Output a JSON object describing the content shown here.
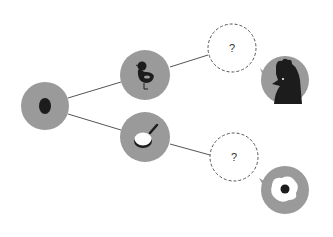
{
  "diagram": {
    "colors": {
      "node_fill": "#9a9a9a",
      "icon_dark": "#1c1c1c",
      "line": "#555555",
      "dashed_stroke": "#555555",
      "background": "#ffffff"
    },
    "nodes": [
      {
        "id": "egg",
        "icon": "egg-icon",
        "label": ""
      },
      {
        "id": "chick",
        "icon": "chick-icon",
        "label": ""
      },
      {
        "id": "pan",
        "icon": "frying-pan-icon",
        "label": ""
      },
      {
        "id": "unknown-top",
        "icon": "",
        "label": "?"
      },
      {
        "id": "unknown-bottom",
        "icon": "",
        "label": "?"
      },
      {
        "id": "chicken",
        "icon": "chicken-head-icon",
        "label": ""
      },
      {
        "id": "fried-egg",
        "icon": "fried-egg-icon",
        "label": ""
      }
    ],
    "edges": [
      {
        "from": "egg",
        "to": "chick"
      },
      {
        "from": "egg",
        "to": "pan"
      },
      {
        "from": "chick",
        "to": "unknown-top"
      },
      {
        "from": "pan",
        "to": "unknown-bottom"
      }
    ],
    "question_top": "?",
    "question_bottom": "?"
  }
}
